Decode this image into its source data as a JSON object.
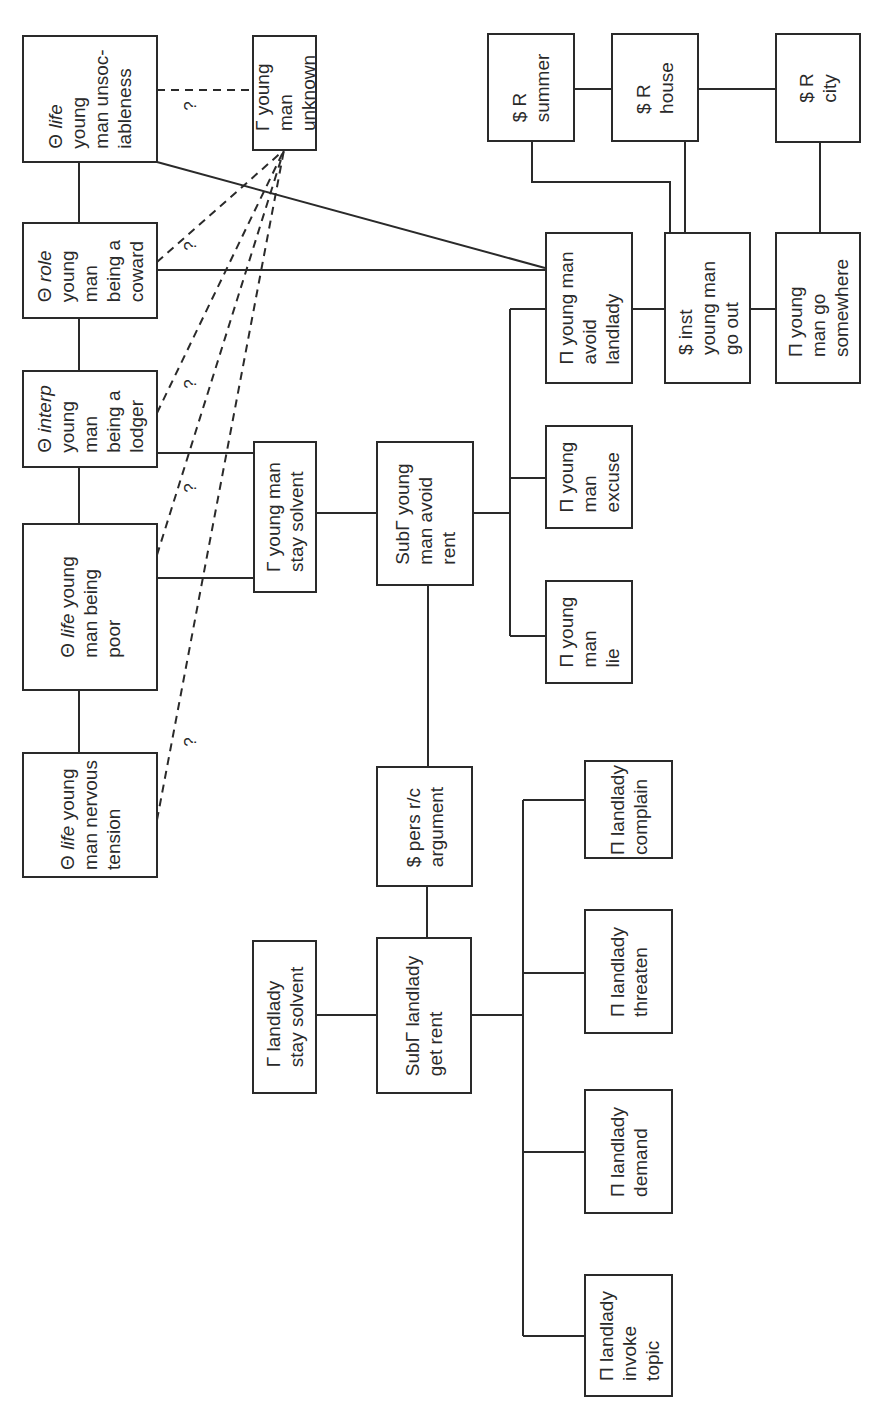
{
  "diagram": {
    "orientation": "rotated 90 degrees counter-clockwise",
    "nodes": {
      "life_unsociableness": {
        "symbol": "Θ",
        "tag": "life",
        "lines": [
          "Θ life",
          "young",
          "man unsoc-",
          "iableness"
        ]
      },
      "young_man_unknown": {
        "symbol": "Γ",
        "lines": [
          "Γ young",
          "man",
          "unknown"
        ]
      },
      "role_coward": {
        "symbol": "Θ",
        "tag": "role",
        "lines": [
          "Θ role",
          "young",
          "man",
          "being a",
          "coward"
        ]
      },
      "interp_lodger": {
        "symbol": "Θ",
        "tag": "interp",
        "lines": [
          "Θ interp",
          "young",
          "man",
          "being a",
          "lodger"
        ]
      },
      "life_poor": {
        "symbol": "Θ",
        "tag": "life",
        "lines": [
          "Θ life young",
          "man being",
          "poor"
        ]
      },
      "life_nervous_tension": {
        "symbol": "Θ",
        "tag": "life",
        "lines": [
          "Θ life young",
          "man nervous",
          "tension"
        ]
      },
      "young_man_stay_solvent": {
        "symbol": "Γ",
        "lines": [
          "Γ young man",
          "stay solvent"
        ]
      },
      "sub_young_man_avoid_rent": {
        "symbol": "SubΓ",
        "lines": [
          "SubΓ young",
          "man avoid",
          "rent"
        ]
      },
      "pers_rc_argument": {
        "symbol": "$",
        "lines": [
          "$ pers r/c",
          "argument"
        ]
      },
      "landlady_stay_solvent": {
        "symbol": "Γ",
        "lines": [
          "Γ landlady",
          "stay solvent"
        ]
      },
      "sub_landlady_get_rent": {
        "symbol": "SubΓ",
        "lines": [
          "SubΓ landlady",
          "get rent"
        ]
      },
      "young_man_lie": {
        "symbol": "Π",
        "lines": [
          "Π young",
          "man",
          "lie"
        ]
      },
      "young_man_excuse": {
        "symbol": "Π",
        "lines": [
          "Π young",
          "man",
          "excuse"
        ]
      },
      "young_man_avoid_landlady": {
        "symbol": "Π",
        "lines": [
          "Π young man",
          "avoid",
          "landlady"
        ]
      },
      "inst_young_man_go_out": {
        "symbol": "$",
        "lines": [
          "$ inst",
          "young man",
          "go out"
        ]
      },
      "young_man_go_somewhere": {
        "symbol": "Π",
        "lines": [
          "Π young",
          "man go",
          "somewhere"
        ]
      },
      "r_summer": {
        "symbol": "$",
        "lines": [
          "$ R",
          "summer"
        ]
      },
      "r_house": {
        "symbol": "$",
        "lines": [
          "$ R",
          "house"
        ]
      },
      "r_city": {
        "symbol": "$",
        "lines": [
          "$ R",
          "city"
        ]
      },
      "landlady_complain": {
        "symbol": "Π",
        "lines": [
          "Π landlady",
          "complain"
        ]
      },
      "landlady_threaten": {
        "symbol": "Π",
        "lines": [
          "Π landlady",
          "threaten"
        ]
      },
      "landlady_demand": {
        "symbol": "Π",
        "lines": [
          "Π landlady",
          "demand"
        ]
      },
      "landlady_invoke_topic": {
        "symbol": "Π",
        "lines": [
          "Π landlady",
          "invoke",
          "topic"
        ]
      }
    },
    "uncertain_link_label": "?",
    "edges_solid": [
      [
        "life_unsociableness",
        "role_coward"
      ],
      [
        "role_coward",
        "interp_lodger"
      ],
      [
        "interp_lodger",
        "life_poor"
      ],
      [
        "life_poor",
        "life_nervous_tension"
      ],
      [
        "interp_lodger",
        "young_man_stay_solvent"
      ],
      [
        "life_poor",
        "young_man_stay_solvent"
      ],
      [
        "young_man_stay_solvent",
        "sub_young_man_avoid_rent"
      ],
      [
        "sub_young_man_avoid_rent",
        "pers_rc_argument"
      ],
      [
        "pers_rc_argument",
        "sub_landlady_get_rent"
      ],
      [
        "landlady_stay_solvent",
        "sub_landlady_get_rent"
      ],
      [
        "sub_young_man_avoid_rent",
        "young_man_avoid_landlady"
      ],
      [
        "sub_young_man_avoid_rent",
        "young_man_excuse"
      ],
      [
        "sub_young_man_avoid_rent",
        "young_man_lie"
      ],
      [
        "life_unsociableness",
        "young_man_avoid_landlady"
      ],
      [
        "role_coward",
        "young_man_avoid_landlady"
      ],
      [
        "young_man_avoid_landlady",
        "inst_young_man_go_out"
      ],
      [
        "inst_young_man_go_out",
        "young_man_go_somewhere"
      ],
      [
        "r_summer",
        "r_house"
      ],
      [
        "r_house",
        "r_city"
      ],
      [
        "r_summer",
        "inst_young_man_go_out"
      ],
      [
        "r_house",
        "inst_young_man_go_out"
      ],
      [
        "r_city",
        "young_man_go_somewhere"
      ],
      [
        "sub_landlady_get_rent",
        "landlady_complain"
      ],
      [
        "sub_landlady_get_rent",
        "landlady_threaten"
      ],
      [
        "sub_landlady_get_rent",
        "landlady_demand"
      ],
      [
        "sub_landlady_get_rent",
        "landlady_invoke_topic"
      ]
    ],
    "edges_dashed_uncertain": [
      [
        "life_unsociableness",
        "young_man_unknown"
      ],
      [
        "role_coward",
        "young_man_unknown"
      ],
      [
        "interp_lodger",
        "young_man_unknown"
      ],
      [
        "life_poor",
        "young_man_unknown"
      ],
      [
        "life_nervous_tension",
        "young_man_unknown"
      ]
    ]
  }
}
